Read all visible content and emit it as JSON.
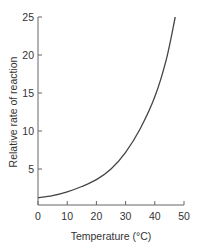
{
  "chart_data": {
    "type": "line",
    "title": "",
    "xlabel": "Temperature (°C)",
    "ylabel": "Relative rate of reaction",
    "xlim": [
      0,
      50
    ],
    "ylim": [
      0,
      25
    ],
    "x_ticks": [
      "0",
      "10",
      "20",
      "30",
      "40",
      "50"
    ],
    "y_ticks": [
      "5",
      "10",
      "15",
      "20",
      "25"
    ],
    "grid": false,
    "legend": null,
    "series": [
      {
        "name": "rate",
        "x": [
          0,
          5,
          10,
          15,
          20,
          25,
          30,
          35,
          40,
          44,
          47
        ],
        "values": [
          1.2,
          1.5,
          2.0,
          2.7,
          3.6,
          5.0,
          7.2,
          10.3,
          14.5,
          19.5,
          25
        ]
      }
    ]
  }
}
